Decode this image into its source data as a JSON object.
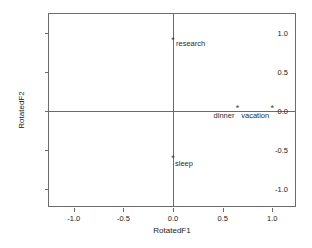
{
  "chart_data": {
    "type": "scatter",
    "title": "",
    "xlabel": "RotatedF1",
    "ylabel": "RotatedF2",
    "xlim": [
      -1.25,
      1.25
    ],
    "ylim": [
      -1.25,
      1.25
    ],
    "xticks": [
      "-1.0",
      "-0.5",
      "0.0",
      "0.5",
      "1.0"
    ],
    "xtickvalues": [
      -1.0,
      -0.5,
      0.0,
      0.5,
      1.0
    ],
    "yticks": [
      "1.0",
      "0.5",
      "0.0",
      "-0.5",
      "-1.0"
    ],
    "ytickvalues": [
      1.0,
      0.5,
      0.0,
      -0.5,
      -1.0
    ],
    "grid": false,
    "legend": "none",
    "reference_lines": {
      "x": 0.0,
      "y": 0.0
    },
    "marker_glyph": "*",
    "points": [
      {
        "label": "research",
        "x": 0.0,
        "y": 0.88,
        "label_position": "right"
      },
      {
        "label": "dinner",
        "x": 0.65,
        "y": 0.0,
        "label_position": "left"
      },
      {
        "label": "vacation",
        "x": 1.0,
        "y": 0.0,
        "label_position": "left"
      },
      {
        "label": "sleep",
        "x": 0.0,
        "y": -0.64,
        "label_position": "right-low"
      }
    ]
  },
  "colors": {
    "axis": "#6b6b6b",
    "text": "#1a1a1a",
    "marker": "#3d3d3d",
    "background": "#ffffff"
  }
}
